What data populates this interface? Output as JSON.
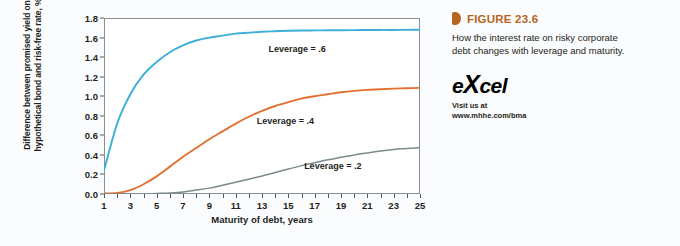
{
  "figure": {
    "marker_icon": "triangle-marker-icon",
    "title": "FIGURE 23.6",
    "description": "How the interest rate on risky corporate debt changes with leverage and maturity.",
    "logo_text_pre": "e",
    "logo_text_x": "X",
    "logo_text_post": "cel",
    "visit_line1": "Visit us at",
    "visit_line2": "www.mhhe.com/bma",
    "title_color": "#b5651d"
  },
  "chart_data": {
    "type": "line",
    "title": "",
    "xlabel": "Maturity of debt, years",
    "ylabel": "Difference between promised yield on hypothetical bond and risk-free rate, %",
    "xlim": [
      1,
      25
    ],
    "ylim": [
      0.0,
      1.8
    ],
    "grid": false,
    "legend_position": "inline-annotations",
    "xticks": [
      1,
      2,
      3,
      4,
      5,
      6,
      7,
      8,
      9,
      10,
      11,
      12,
      13,
      14,
      15,
      16,
      17,
      18,
      19,
      20,
      21,
      22,
      23,
      24,
      25
    ],
    "xtick_labels": [
      "1",
      "",
      "3",
      "",
      "5",
      "",
      "7",
      "",
      "9",
      "",
      "11",
      "",
      "13",
      "",
      "15",
      "",
      "17",
      "",
      "19",
      "",
      "21",
      "",
      "23",
      "",
      "25"
    ],
    "yticks": [
      0.0,
      0.2,
      0.4,
      0.6,
      0.8,
      1.0,
      1.2,
      1.4,
      1.6,
      1.8
    ],
    "ytick_labels": [
      "0.0",
      "0.2",
      "0.4",
      "0.6",
      "0.8",
      "1.0",
      "1.2",
      "1.4",
      "1.6",
      "1.8"
    ],
    "x": [
      1,
      2,
      3,
      4,
      5,
      6,
      7,
      8,
      9,
      10,
      11,
      12,
      13,
      14,
      15,
      16,
      17,
      18,
      19,
      20,
      21,
      22,
      23,
      24,
      25
    ],
    "series": [
      {
        "name": "Leverage = .6",
        "color": "#3bafda",
        "label_x": 13.5,
        "label_y": 1.47,
        "values": [
          0.24,
          0.72,
          1.02,
          1.22,
          1.35,
          1.45,
          1.52,
          1.57,
          1.6,
          1.62,
          1.64,
          1.65,
          1.66,
          1.665,
          1.67,
          1.672,
          1.673,
          1.674,
          1.675,
          1.676,
          1.677,
          1.678,
          1.678,
          1.679,
          1.68
        ]
      },
      {
        "name": "Leverage = .4",
        "color": "#e0712f",
        "label_x": 12.6,
        "label_y": 0.74,
        "values": [
          0.005,
          0.01,
          0.04,
          0.1,
          0.18,
          0.28,
          0.38,
          0.47,
          0.56,
          0.64,
          0.72,
          0.79,
          0.85,
          0.9,
          0.94,
          0.975,
          1.0,
          1.02,
          1.04,
          1.055,
          1.065,
          1.072,
          1.078,
          1.082,
          1.085
        ]
      },
      {
        "name": "Leverage = .2",
        "color": "#7a8c8a",
        "label_x": 16.2,
        "label_y": 0.28,
        "values": [
          0.0,
          0.0,
          0.0,
          0.0,
          0.005,
          0.01,
          0.02,
          0.04,
          0.06,
          0.09,
          0.12,
          0.15,
          0.185,
          0.22,
          0.255,
          0.29,
          0.32,
          0.35,
          0.375,
          0.4,
          0.42,
          0.44,
          0.455,
          0.465,
          0.475
        ]
      }
    ]
  }
}
